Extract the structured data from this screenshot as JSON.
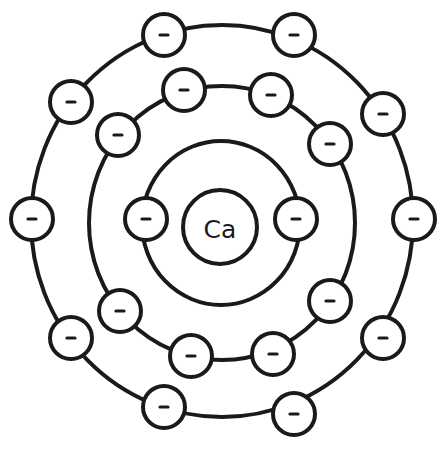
{
  "diagram": {
    "type": "bohr-atom-model",
    "nucleus": {
      "symbol": "Ca",
      "cx": 220,
      "cy": 227,
      "r": 37
    },
    "electron_symbol": "-",
    "electron_radius": 21,
    "colors": {
      "stroke": "#1a1a1a",
      "fill": "#ffffff",
      "background": "#ffffff"
    },
    "shells": [
      {
        "name": "shell-2",
        "cx": 221,
        "cy": 223,
        "rx": 79,
        "ry": 82,
        "electrons": [
          [
            146,
            219
          ],
          [
            296,
            219
          ]
        ]
      },
      {
        "name": "shell-3",
        "cx": 222,
        "cy": 223,
        "rx": 133,
        "ry": 137,
        "electrons": [
          [
            184,
            90
          ],
          [
            271,
            95
          ],
          [
            330,
            144
          ],
          [
            118,
            135
          ],
          [
            120,
            311
          ],
          [
            191,
            356
          ],
          [
            273,
            354
          ],
          [
            330,
            301
          ]
        ]
      },
      {
        "name": "shell-4",
        "cx": 222,
        "cy": 221,
        "rx": 191,
        "ry": 196,
        "electrons": [
          [
            164,
            35
          ],
          [
            294,
            35
          ],
          [
            383,
            114
          ],
          [
            414,
            219
          ],
          [
            383,
            338
          ],
          [
            294,
            414
          ],
          [
            164,
            407
          ],
          [
            71,
            338
          ],
          [
            32,
            219
          ],
          [
            71,
            102
          ]
        ]
      }
    ]
  }
}
